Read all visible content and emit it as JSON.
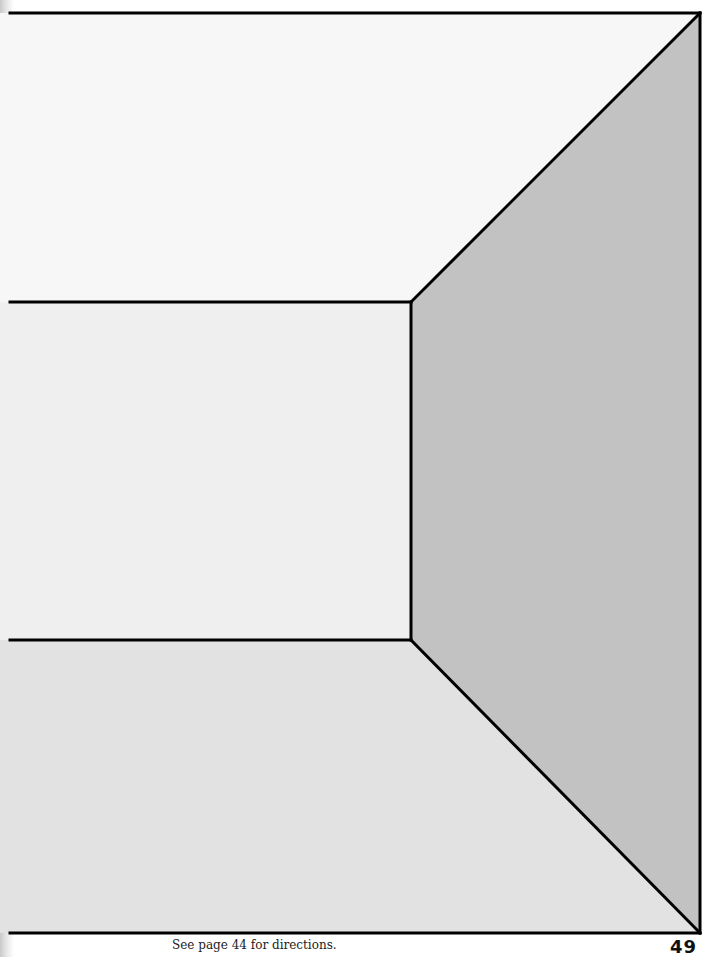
{
  "page": {
    "caption": "See page 44 for directions.",
    "page_number": "49"
  },
  "drawing": {
    "subject": "one-point perspective room interior",
    "regions": [
      {
        "name": "ceiling",
        "color": "#f7f7f7"
      },
      {
        "name": "back-wall",
        "color": "#efefef"
      },
      {
        "name": "floor",
        "color": "#e2e2e2"
      },
      {
        "name": "right-wall",
        "color": "#c2c2c2"
      }
    ],
    "line_color": "#000000"
  }
}
